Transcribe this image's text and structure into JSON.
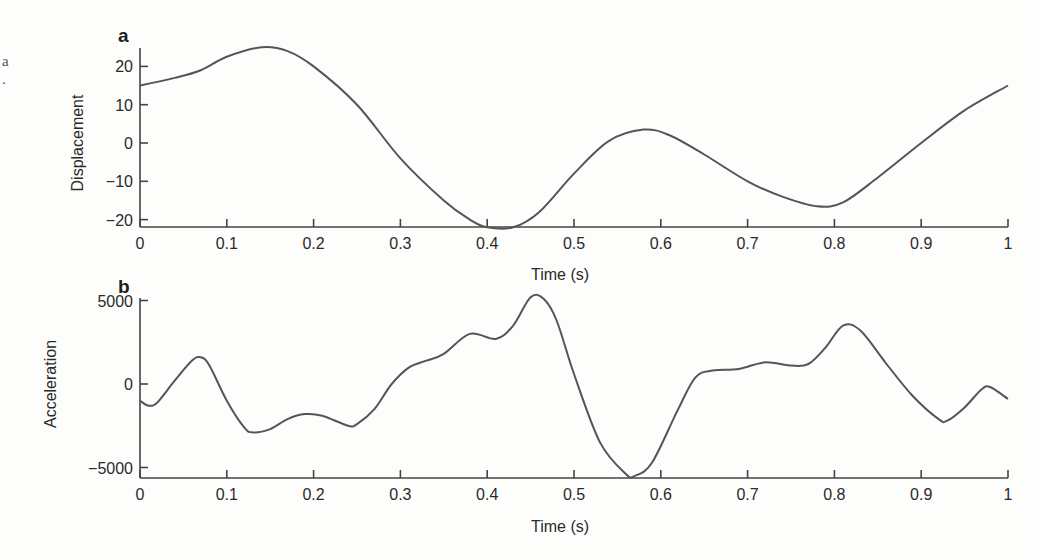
{
  "edge_fragment": "a",
  "chart_data": [
    {
      "panel": "a",
      "type": "line",
      "title": "",
      "xlabel": "Time (s)",
      "ylabel": "Displacement",
      "xlim": [
        0,
        1
      ],
      "ylim": [
        -22,
        26
      ],
      "xticks": [
        "0",
        "0.1",
        "0.2",
        "0.3",
        "0.4",
        "0.5",
        "0.6",
        "0.7",
        "0.8",
        "0.9",
        "1"
      ],
      "yticks": [
        "20",
        "10",
        "0",
        "−10",
        "−20"
      ],
      "grid": false,
      "legend": null,
      "line_color": "#555555",
      "x": [
        0,
        0.04,
        0.07,
        0.1,
        0.14,
        0.17,
        0.2,
        0.25,
        0.3,
        0.35,
        0.38,
        0.4,
        0.43,
        0.46,
        0.5,
        0.54,
        0.58,
        0.61,
        0.65,
        0.7,
        0.74,
        0.78,
        0.81,
        0.85,
        0.9,
        0.95,
        1
      ],
      "y": [
        15,
        17,
        19,
        22.5,
        25,
        24,
        20,
        10,
        -4,
        -15,
        -20,
        -22,
        -22,
        -18,
        -8,
        0.5,
        3.5,
        2,
        -3,
        -10,
        -14,
        -16.5,
        -15.5,
        -9,
        0,
        8.5,
        15
      ]
    },
    {
      "panel": "b",
      "type": "line",
      "title": "",
      "xlabel": "Time (s)",
      "ylabel": "Acceleration",
      "xlim": [
        0,
        1
      ],
      "ylim": [
        -5600,
        5600
      ],
      "xticks": [
        "0",
        "0.1",
        "0.2",
        "0.3",
        "0.4",
        "0.5",
        "0.6",
        "0.7",
        "0.8",
        "0.9",
        "1"
      ],
      "yticks": [
        "5000",
        "0",
        "−5000"
      ],
      "grid": false,
      "legend": null,
      "line_color": "#555555",
      "x": [
        0,
        0.01,
        0.02,
        0.04,
        0.06,
        0.07,
        0.08,
        0.1,
        0.12,
        0.13,
        0.15,
        0.17,
        0.19,
        0.21,
        0.24,
        0.25,
        0.27,
        0.29,
        0.31,
        0.33,
        0.35,
        0.38,
        0.41,
        0.43,
        0.45,
        0.465,
        0.48,
        0.5,
        0.53,
        0.56,
        0.57,
        0.59,
        0.62,
        0.64,
        0.66,
        0.69,
        0.72,
        0.75,
        0.77,
        0.79,
        0.81,
        0.83,
        0.86,
        0.89,
        0.92,
        0.93,
        0.95,
        0.97,
        0.98,
        1
      ],
      "y": [
        -1000,
        -1300,
        -1100,
        200,
        1400,
        1600,
        1100,
        -1000,
        -2600,
        -2900,
        -2700,
        -2100,
        -1800,
        -1900,
        -2500,
        -2400,
        -1500,
        0,
        1000,
        1400,
        1800,
        3000,
        2700,
        3500,
        5200,
        5100,
        3800,
        600,
        -3500,
        -5400,
        -5500,
        -4700,
        -1500,
        400,
        800,
        900,
        1300,
        1100,
        1200,
        2200,
        3500,
        3200,
        1200,
        -700,
        -2100,
        -2200,
        -1400,
        -300,
        -200,
        -900
      ]
    }
  ]
}
